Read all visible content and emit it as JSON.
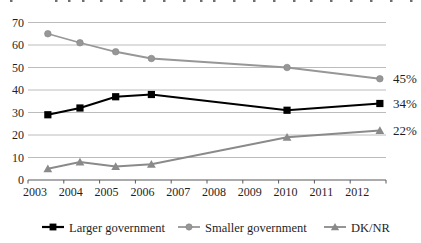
{
  "chart_data": {
    "type": "line",
    "title": "",
    "xlabel": "",
    "ylabel": "",
    "x": [
      2003.5,
      2004.4,
      2005.4,
      2006.4,
      2010.2,
      2012.8
    ],
    "series": [
      {
        "name": "Larger government",
        "marker": "square",
        "color": "#000000",
        "line_width": 2.2,
        "values": [
          29,
          32,
          37,
          38,
          31,
          34
        ],
        "end_label": "34%"
      },
      {
        "name": "Smaller government",
        "marker": "circle",
        "color": "#979797",
        "line_width": 1.8,
        "values": [
          65,
          61,
          57,
          54,
          50,
          45
        ],
        "end_label": "45%"
      },
      {
        "name": "DK/NR",
        "marker": "triangle",
        "color": "#8a8a8a",
        "line_width": 1.8,
        "values": [
          5,
          8,
          6,
          7,
          19,
          22
        ],
        "end_label": "22%"
      }
    ],
    "x_tick_labels": [
      "2003",
      "2004",
      "2005",
      "2006",
      "2007",
      "2008",
      "2009",
      "2010",
      "2011",
      "2012"
    ],
    "y_tick_labels": [
      "0",
      "10",
      "20",
      "30",
      "40",
      "50",
      "60",
      "70"
    ],
    "y_ticks": [
      0,
      10,
      20,
      30,
      40,
      50,
      60,
      70
    ],
    "ylim": [
      0,
      70
    ],
    "xlim": [
      2003,
      2013
    ],
    "grid": true,
    "legend_position": "bottom",
    "end_labels": [
      "45%",
      "34%",
      "22%"
    ]
  },
  "colors": {
    "background": "#ffffff",
    "gridline": "#ababab",
    "axis_line": "#595959",
    "tick": "#595959",
    "text": "#1f1f1f"
  },
  "cropped_top_text_fragments_x": [
    10,
    55,
    68,
    82,
    100,
    120,
    143,
    163,
    183,
    200,
    213,
    233,
    253,
    273,
    293,
    310,
    330,
    350,
    370,
    390,
    410
  ]
}
